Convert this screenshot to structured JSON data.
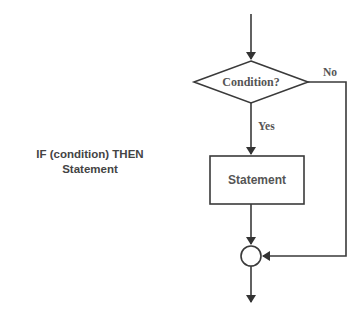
{
  "caption": {
    "line1": "IF (condition) THEN",
    "line2": "Statement"
  },
  "flowchart": {
    "decision_label": "Condition?",
    "yes_label": "Yes",
    "no_label": "No",
    "process_label": "Statement",
    "stroke_color": "#3a3a3a",
    "text_color": "#555555"
  }
}
